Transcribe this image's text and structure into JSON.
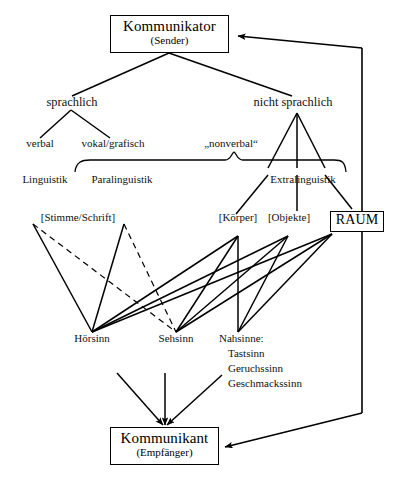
{
  "diagram": {
    "title_node": {
      "main": "Kommunikator",
      "sub": "(Sender)"
    },
    "bottom_node": {
      "main": "Kommunikant",
      "sub": "(Empfänger)"
    },
    "space_node": {
      "main": "RAUM"
    },
    "branches": {
      "left": "sprachlich",
      "right": "nicht sprachlich"
    },
    "sub_branches": {
      "verbal": "verbal",
      "vokal_grafisch": "vokal/grafisch",
      "nonverbal": "„nonverbal“"
    },
    "disciplines": {
      "linguistik": "Linguistik",
      "paralinguistik": "Paralinguistik",
      "extralinguistik": "Extralinguistik"
    },
    "channels": {
      "stimme_schrift": "[Stimme/Schrift]",
      "koerper": "[Körper]",
      "objekte": "[Objekte]"
    },
    "senses": {
      "hoersinn": "Hörsinn",
      "sehsinn": "Sehsinn",
      "nahsinne_title": "Nahsinne:",
      "nahsinne_items": [
        "Tastsinn",
        "Geruchssinn",
        "Geschmackssinn"
      ]
    },
    "colors": {
      "ink": "#000000",
      "paper": "#ffffff"
    }
  }
}
